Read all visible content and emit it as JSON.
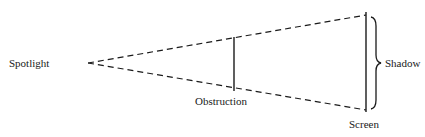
{
  "diagram": {
    "labels": {
      "spotlight": "Spotlight",
      "obstruction": "Obstruction",
      "shadow": "Shadow",
      "screen": "Screen"
    },
    "colors": {
      "ink": "#1a1a1a",
      "background": "#ffffff"
    }
  }
}
